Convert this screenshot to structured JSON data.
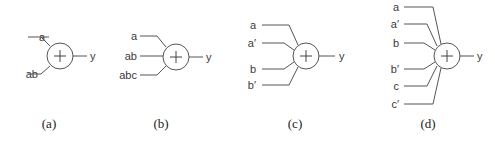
{
  "figure": {
    "panels": [
      {
        "caption": "(a)",
        "gate": "plus",
        "inputs": [
          "a",
          "ab"
        ],
        "output": "y"
      },
      {
        "caption": "(b)",
        "gate": "plus",
        "inputs": [
          "a",
          "ab",
          "abc"
        ],
        "output": "y"
      },
      {
        "caption": "(c)",
        "gate": "plus",
        "inputs": [
          "a",
          "a′",
          "b",
          "b′"
        ],
        "output": "y"
      },
      {
        "caption": "(d)",
        "gate": "plus",
        "inputs": [
          "a",
          "a′",
          "b",
          "b′",
          "c",
          "c′"
        ],
        "output": "y"
      }
    ]
  },
  "colors": {
    "stroke": "#555555",
    "text": "#3a3a3a",
    "background": "#ffffff"
  }
}
